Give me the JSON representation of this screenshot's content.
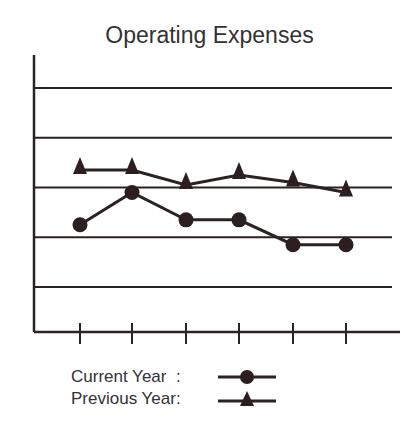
{
  "chart_data": {
    "type": "line",
    "title": "Operating Expenses",
    "xlabel": "",
    "ylabel": "",
    "categories": [
      "1",
      "2",
      "3",
      "4",
      "5",
      "6"
    ],
    "x_tick_labels_visible": false,
    "y_tick_labels_visible": false,
    "gridlines_y": [
      1,
      2,
      3,
      4,
      5
    ],
    "ylim": [
      0,
      5.8
    ],
    "grid": true,
    "legend_position": "bottom-left",
    "series": [
      {
        "name": "Current Year",
        "marker": "circle",
        "values": [
          2.25,
          2.9,
          2.35,
          2.35,
          1.85,
          1.85
        ]
      },
      {
        "name": "Previous Year",
        "marker": "triangle",
        "values": [
          3.35,
          3.35,
          3.05,
          3.25,
          3.1,
          2.9
        ]
      }
    ]
  },
  "legend": {
    "current_label": "Current Year  :",
    "previous_label": "Previous Year:"
  },
  "colors": {
    "line": "#2b2222",
    "marker": "#2b1f1f"
  }
}
